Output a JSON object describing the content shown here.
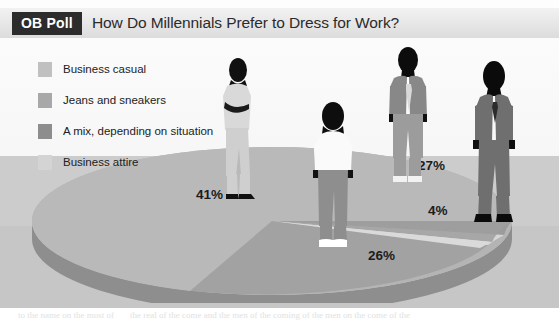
{
  "header": {
    "badge_label": "OB Poll",
    "title": "How Do Millennials Prefer to Dress for Work?"
  },
  "colors": {
    "badge_bg": "#2c2c2c",
    "slice_business_casual": "#b4b4b4",
    "slice_jeans_sneakers": "#9a9a9a",
    "slice_mix": "#868686",
    "slice_business_attire": "#c9c9c9",
    "pie_rim": "#8e8e8e",
    "floor": "#cccccc",
    "label_text": "#1c1c1c"
  },
  "legend": {
    "items": [
      {
        "label": "Business casual",
        "color": "#c0c0c0",
        "swatch_name": "swatch-business-casual"
      },
      {
        "label": "Jeans and sneakers",
        "color": "#a8a8a8",
        "swatch_name": "swatch-jeans-sneakers"
      },
      {
        "label": "A mix, depending on situation",
        "color": "#8d8d8d",
        "swatch_name": "swatch-mix"
      },
      {
        "label": "Business attire",
        "color": "#d4d4d4",
        "swatch_name": "swatch-business-attire"
      }
    ]
  },
  "labels": {
    "pct_business_casual": "41%",
    "pct_jeans_sneakers": "26%",
    "pct_mix": "27%",
    "pct_business_attire": "4%"
  },
  "figures": [
    {
      "name": "figure-business-casual-woman",
      "description": "woman in light pantsuit, arms crossed"
    },
    {
      "name": "figure-jeans-sneakers-woman",
      "description": "woman in white tee, jeans and white sneakers"
    },
    {
      "name": "figure-mix-man",
      "description": "man in blazer, tie and light trousers"
    },
    {
      "name": "figure-business-attire-man",
      "description": "man in dark business suit"
    }
  ],
  "ghost_text": [
    {
      "text": "are few days off, 100 bucks in my",
      "x": 196,
      "y": 48,
      "size": 11
    },
    {
      "text": "finding out who your wife and my",
      "x": 170,
      "y": 62,
      "size": 11
    },
    {
      "text": "A. Long, and I are in the office.",
      "x": 158,
      "y": 76,
      "size": 11
    },
    {
      "text": "They are unrivaled in the market of",
      "x": 150,
      "y": 90,
      "size": 11
    },
    {
      "text": "Chortle, as soon as they had to stop",
      "x": 148,
      "y": 104,
      "size": 11
    },
    {
      "text": "in the lift hall",
      "x": 176,
      "y": 118,
      "size": 11
    },
    {
      "text": "can so the way to all",
      "x": 28,
      "y": 120,
      "size": 11
    },
    {
      "text": "one is the spirit of",
      "x": 22,
      "y": 136,
      "size": 11
    },
    {
      "text": "a long and for the",
      "x": 22,
      "y": 152,
      "size": 11
    },
    {
      "text": "the air to what",
      "x": 34,
      "y": 168,
      "size": 11
    },
    {
      "text": "and the most",
      "x": 34,
      "y": 184,
      "size": 11
    },
    {
      "text": "and Value to",
      "x": 368,
      "y": 216,
      "size": 13
    },
    {
      "text": "to the name on the most of",
      "x": 20,
      "y": 318,
      "size": 9
    },
    {
      "text": "the real of the come and the men of the coming of the men on the come of the",
      "x": 120,
      "y": 318,
      "size": 9
    }
  ]
}
